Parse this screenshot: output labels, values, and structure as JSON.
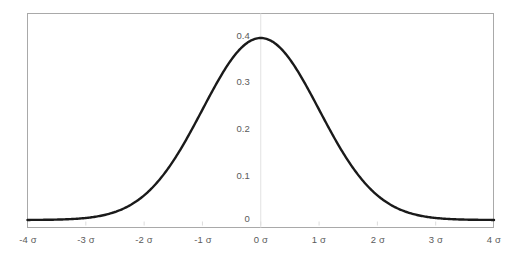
{
  "figure": {
    "kind": "standard-normal-distribution-curve",
    "background_color": "#ffffff",
    "frame_color": "#a9a9a9",
    "gridline_color": "#e2e2e2",
    "tick_label_color": "#5a5a5a",
    "curve_color": "#1a1a1a"
  },
  "chart_data": {
    "type": "line",
    "title": "",
    "subtitle": "",
    "xlabel": "",
    "ylabel": "",
    "xlim": [
      -4,
      4
    ],
    "ylim": [
      0,
      0.43
    ],
    "grid": "vertical-center-only",
    "legend": "none",
    "annotations": [],
    "x_tick_labels": [
      "-4 σ",
      "-3 σ",
      "-2 σ",
      "-1 σ",
      "0 σ",
      "1 σ",
      "2 σ",
      "3 σ",
      "4 σ"
    ],
    "x_tick_values": [
      -4,
      -3,
      -2,
      -1,
      0,
      1,
      2,
      3,
      4
    ],
    "y_tick_labels": [
      "0",
      "0.1",
      "0.2",
      "0.3",
      "0.4"
    ],
    "y_tick_values": [
      0,
      0.1,
      0.2,
      0.3,
      0.4
    ],
    "series": [
      {
        "name": "Normal probability density",
        "x": [
          -4,
          -3.8,
          -3.6,
          -3.4,
          -3.2,
          -3,
          -2.8,
          -2.6,
          -2.4,
          -2.2,
          -2,
          -1.8,
          -1.6,
          -1.4,
          -1.2,
          -1,
          -0.8,
          -0.6,
          -0.4,
          -0.2,
          0,
          0.2,
          0.4,
          0.6,
          0.8,
          1,
          1.2,
          1.4,
          1.6,
          1.8,
          2,
          2.2,
          2.4,
          2.6,
          2.8,
          3,
          3.2,
          3.4,
          3.6,
          3.8,
          4
        ],
        "values": [
          0.0001,
          0.0003,
          0.0006,
          0.0012,
          0.0024,
          0.0044,
          0.0079,
          0.0136,
          0.0224,
          0.0355,
          0.054,
          0.079,
          0.1109,
          0.1497,
          0.1942,
          0.242,
          0.2897,
          0.3332,
          0.3683,
          0.391,
          0.3989,
          0.391,
          0.3683,
          0.3332,
          0.2897,
          0.242,
          0.1942,
          0.1497,
          0.1109,
          0.079,
          0.054,
          0.0355,
          0.0224,
          0.0136,
          0.0079,
          0.0044,
          0.0024,
          0.0012,
          0.0006,
          0.0003,
          0.0001
        ]
      }
    ]
  },
  "y_axis": {
    "ticks": [
      {
        "label": "0.4",
        "value": 0.4
      },
      {
        "label": "0.3",
        "value": 0.3
      },
      {
        "label": "0.2",
        "value": 0.2
      },
      {
        "label": "0.1",
        "value": 0.1
      },
      {
        "label": "0",
        "value": 0
      }
    ]
  },
  "x_axis": {
    "ticks": [
      {
        "label": "-4 σ",
        "value": -4
      },
      {
        "label": "-3 σ",
        "value": -3
      },
      {
        "label": "-2 σ",
        "value": -2
      },
      {
        "label": "-1 σ",
        "value": -1
      },
      {
        "label": "0 σ",
        "value": 0
      },
      {
        "label": "1 σ",
        "value": 1
      },
      {
        "label": "2 σ",
        "value": 2
      },
      {
        "label": "3 σ",
        "value": 3
      },
      {
        "label": "4 σ",
        "value": 4
      }
    ]
  }
}
